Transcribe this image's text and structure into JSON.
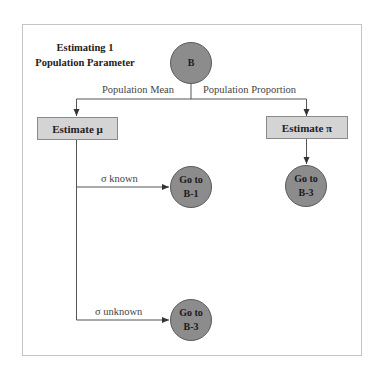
{
  "title": {
    "line1": "Estimating 1",
    "line2": "Population Parameter"
  },
  "nodes": {
    "root": {
      "label": "B"
    },
    "estimate_mean": {
      "label": "Estimate μ"
    },
    "estimate_proportion": {
      "label": "Estimate π"
    },
    "goto_b1_known": {
      "line1": "Go to",
      "line2": "B-1"
    },
    "goto_b3_unknown": {
      "line1": "Go to",
      "line2": "B-3"
    },
    "goto_b3_proportion": {
      "line1": "Go to",
      "line2": "B-3"
    }
  },
  "edges": {
    "population_mean": "Population Mean",
    "population_proportion": "Population Proportion",
    "sigma_known": "σ known",
    "sigma_unknown": "σ unknown"
  },
  "colors": {
    "circle_fill": "#8c8c8c",
    "box_fill": "#d4d4d4",
    "line": "#555555",
    "frame": "#c4c4c4"
  }
}
